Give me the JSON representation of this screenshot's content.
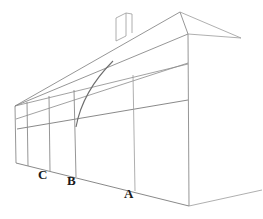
{
  "figure": {
    "kind": "hand-drawn-perspective-drawing",
    "canvas": {
      "width": 263,
      "height": 219
    },
    "background_color": "#ffffff",
    "line_color": "#8a8a8a",
    "line_color_dark": "#6e6e6e",
    "line_color_light": "#aaaaaa",
    "label_color": "#1a1a1a",
    "line_width": 0.8
  },
  "labels": [
    {
      "id": "label-c",
      "text": "C",
      "x": 38,
      "y": 175,
      "font_size": 13
    },
    {
      "id": "label-b",
      "text": "B",
      "x": 67,
      "y": 181,
      "font_size": 13
    },
    {
      "id": "label-a",
      "text": "A",
      "x": 124,
      "y": 194,
      "font_size": 13
    }
  ],
  "geometry": {
    "roof_ridge": {
      "name": "roof-ridge-line",
      "points": "15,106 180,12"
    },
    "roof_eave_far": {
      "name": "roof-eave-far-line",
      "points": "15,106 188,34"
    },
    "ridge_to_eave_right": {
      "name": "right-gable-slope",
      "points": "180,12 188,34"
    },
    "ridge_to_right_tip": {
      "name": "ridge-right-overhang",
      "points": "180,12 241,38"
    },
    "eave_to_right_tip": {
      "name": "eave-right-overhang",
      "points": "188,34 241,38"
    },
    "wall_top_line": {
      "name": "wall-top-perspective-line",
      "points": "15,106 188,64"
    },
    "wall_mid_line": {
      "name": "wall-middle-perspective-line",
      "points": "16,119 188,63"
    },
    "wall_rail_line": {
      "name": "wall-rail-perspective-line",
      "points": "17,129 188,100"
    },
    "base_line": {
      "name": "ground-base-line",
      "points": "16,163 189,206"
    },
    "base_line_right": {
      "name": "ground-base-right-line",
      "points": "189,206 262,190"
    },
    "posts": [
      {
        "name": "post-left-end",
        "x1": 15,
        "y1": 106,
        "x2": 16,
        "y2": 163
      },
      {
        "name": "post-second",
        "x1": 27,
        "y1": 102,
        "x2": 28,
        "y2": 166
      },
      {
        "name": "post-c",
        "x1": 49,
        "y1": 96,
        "x2": 50,
        "y2": 171
      },
      {
        "name": "post-b",
        "x1": 74,
        "y1": 90,
        "x2": 76,
        "y2": 177
      },
      {
        "name": "post-a",
        "x1": 133,
        "y1": 75,
        "x2": 135,
        "y2": 191
      },
      {
        "name": "post-right-end",
        "x1": 188,
        "y1": 34,
        "x2": 189,
        "y2": 206
      }
    ],
    "curve": {
      "name": "curved-brace-line",
      "path": "M 76,127 C 80,105 92,82 113,61"
    },
    "chimney": {
      "name": "chimney-shape",
      "left_x": 116,
      "right_x": 132,
      "top_y": 13,
      "bottom_left_y": 41,
      "bottom_right_y": 33,
      "mid_x": 126
    }
  }
}
